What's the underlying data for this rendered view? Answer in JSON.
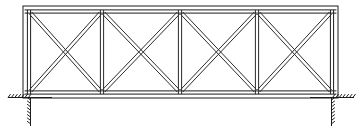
{
  "diagram": {
    "type": "structural-truss-elevation",
    "background_color": "#ffffff",
    "line_color": "#2b2b2b",
    "accent_color": "#1c1c1c",
    "caption": "",
    "geometry": {
      "canvas_width": 362,
      "canvas_height": 129,
      "outer_frame": {
        "left": 23,
        "right": 338,
        "top": 6,
        "bottom": 98
      },
      "inner_frame": {
        "left": 29,
        "right": 332,
        "top": 11.5,
        "bottom": 92.5
      },
      "member_thickness": 3.2,
      "panel_count": 4,
      "vertical_x": [
        29,
        102,
        180,
        257,
        332
      ],
      "chord_top_y": 11.5,
      "chord_bottom_y": 92.5
    },
    "members": {
      "top_chord_label": "top chord",
      "bottom_chord_label": "bottom chord",
      "vertical_label": "vertical post",
      "diagonal_label": "diagonal brace"
    },
    "panels": [
      {
        "name": "panel-1",
        "x_left": 29,
        "x_right": 102,
        "bracing": "x-cross"
      },
      {
        "name": "panel-2",
        "x_left": 102,
        "x_right": 180,
        "bracing": "x-cross"
      },
      {
        "name": "panel-3",
        "x_left": 180,
        "x_right": 257,
        "bracing": "x-cross"
      },
      {
        "name": "panel-4",
        "x_left": 257,
        "x_right": 332,
        "bracing": "x-cross"
      }
    ],
    "supports": [
      {
        "name": "support-left",
        "x": 30.5,
        "ground_y": 97.5,
        "ground_x_start": 8,
        "ground_x_end": 52,
        "post_bottom_y": 126,
        "hatch_side": "left",
        "type": "fixed-ground-hatched"
      },
      {
        "name": "support-right",
        "x": 331.5,
        "ground_y": 97.5,
        "ground_x_start": 310,
        "ground_x_end": 354,
        "post_bottom_y": 126,
        "hatch_side": "right",
        "type": "fixed-ground-hatched"
      }
    ]
  }
}
